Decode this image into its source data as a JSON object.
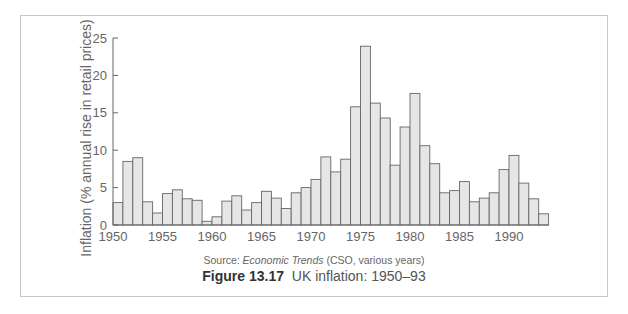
{
  "figure": {
    "source_prefix": "Source: ",
    "source_title": "Economic Trends",
    "source_suffix": " (CSO, various years)",
    "caption_label": "Figure 13.17",
    "caption_text": "UK inflation: 1950–93"
  },
  "chart_data": {
    "type": "bar",
    "title": "UK inflation: 1950–93",
    "xlabel": "",
    "ylabel": "Inflation (% annual rise in retail prices)",
    "ylim": [
      0,
      25
    ],
    "yticks": [
      0,
      5,
      10,
      15,
      20,
      25
    ],
    "xticks": [
      1950,
      1955,
      1960,
      1965,
      1970,
      1975,
      1980,
      1985,
      1990
    ],
    "grid": false,
    "legend": null,
    "bar_color": "#e6e6e6",
    "bar_edge_color": "#666666",
    "categories": [
      1950,
      1951,
      1952,
      1953,
      1954,
      1955,
      1956,
      1957,
      1958,
      1959,
      1960,
      1961,
      1962,
      1963,
      1964,
      1965,
      1966,
      1967,
      1968,
      1969,
      1970,
      1971,
      1972,
      1973,
      1974,
      1975,
      1976,
      1977,
      1978,
      1979,
      1980,
      1981,
      1982,
      1983,
      1984,
      1985,
      1986,
      1987,
      1988,
      1989,
      1990,
      1991,
      1992,
      1993
    ],
    "values": [
      3.0,
      8.5,
      9.0,
      3.1,
      1.6,
      4.2,
      4.7,
      3.5,
      3.3,
      0.5,
      1.1,
      3.2,
      3.9,
      2.0,
      3.0,
      4.5,
      3.6,
      2.2,
      4.3,
      5.0,
      6.1,
      9.1,
      7.1,
      8.8,
      15.8,
      23.9,
      16.3,
      14.3,
      8.0,
      13.1,
      17.6,
      10.6,
      8.2,
      4.3,
      4.6,
      5.8,
      3.1,
      3.6,
      4.3,
      7.4,
      9.3,
      5.6,
      3.5,
      1.5
    ]
  }
}
